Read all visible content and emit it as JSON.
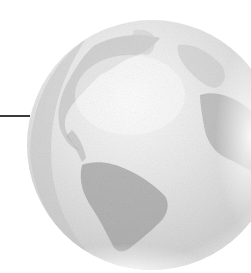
{
  "figure": {
    "caption": "",
    "colors": {
      "background": "#ffffff",
      "globe_base": "#dcdcdc",
      "globe_shadow": "#b8b8b8",
      "landmass": "#a9a9a9",
      "highlight": "#f6f6f6",
      "leader_line": "#3a3a3a"
    },
    "leader_line": {
      "x1": 0,
      "x2": 30,
      "y": 116
    },
    "globe": {
      "cx": 152,
      "cy": 145,
      "r": 125
    }
  }
}
